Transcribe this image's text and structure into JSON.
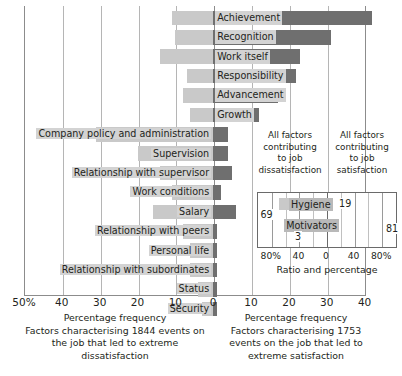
{
  "chart_data": {
    "type": "bar",
    "title": "",
    "orientation": "horizontal-diverging",
    "xlabel": "Percentage frequency",
    "axis": {
      "ticks_left": [
        "50%",
        "40",
        "30",
        "20",
        "10"
      ],
      "tick_zero": "0",
      "ticks_right": [
        "10",
        "20",
        "30",
        "40"
      ],
      "xmin_left": 50,
      "xmax_right": 45,
      "grid": true
    },
    "series": [
      {
        "name": "Factors leading to extreme dissatisfaction",
        "color": "#c9c9c9",
        "side": "left"
      },
      {
        "name": "Factors leading to extreme satisfaction",
        "color": "#6f6f6f",
        "side": "right"
      }
    ],
    "categories": [
      "Achievement",
      "Recognition",
      "Work itself",
      "Responsibility",
      "Advancement",
      "Growth",
      "Company policy and administration",
      "Supervision",
      "Relationship with supervisor",
      "Work conditions",
      "Salary",
      "Relationship with peers",
      "Personal life",
      "Relationship with subordinates",
      "Status",
      "Security"
    ],
    "dissatisfaction_values": [
      11,
      10,
      14,
      7,
      8,
      6,
      31,
      20,
      14,
      11,
      16,
      8,
      6,
      6,
      4,
      3
    ],
    "satisfaction_values": [
      42,
      31,
      23,
      22,
      17,
      12,
      4,
      4,
      5,
      2,
      6,
      1,
      1,
      1,
      1,
      1
    ]
  },
  "captions": {
    "left": {
      "heading": "Percentage frequency",
      "line1": "Factors characterising 1844 events on",
      "line2": "the job that led to extreme",
      "line3": "dissatisfaction"
    },
    "right": {
      "heading": "Percentage frequency",
      "line1": "Factors characterising 1753",
      "line2": "events on the job that led to",
      "line3": "extreme satisfaction"
    }
  },
  "inset": {
    "head_left": "All factors\ncontributing\nto job\ndissatisfaction",
    "head_left_lines": [
      "All factors",
      "contributing",
      "to job",
      "dissatisfaction"
    ],
    "head_right_lines": [
      "All factors",
      "contributing",
      "to job",
      "satisfaction"
    ],
    "axis_label": "Ratio and percentage",
    "ticks": [
      "80%",
      "40",
      "0",
      "40",
      "80%"
    ],
    "chart_data": {
      "type": "bar",
      "orientation": "horizontal-diverging",
      "categories": [
        "Hygiene",
        "Motivators"
      ],
      "dissatisfaction_values": [
        69,
        31
      ],
      "satisfaction_values": [
        19,
        81
      ],
      "labels": {
        "hygiene": "Hygiene",
        "motivators": "Motivators"
      },
      "value_labels": {
        "hygiene_left": "69",
        "hygiene_right": "19",
        "motivators_left": "3",
        "motivators_right": "81"
      }
    }
  }
}
